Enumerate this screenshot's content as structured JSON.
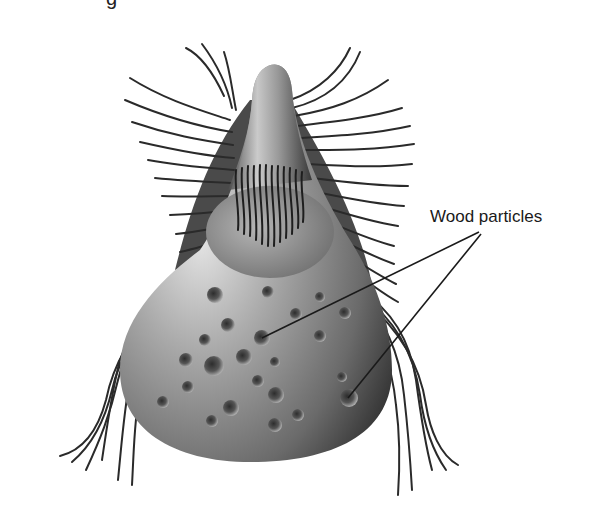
{
  "figure": {
    "cropped_top_text_fragment": "g",
    "labels": [
      {
        "id": "wood-particles",
        "text": "Wood particles",
        "x": 430,
        "y": 207
      }
    ],
    "pointer_lines": [
      {
        "from": [
          479,
          232
        ],
        "to": [
          262,
          338
        ]
      },
      {
        "from": [
          481,
          234
        ],
        "to": [
          348,
          398
        ]
      }
    ],
    "wood_particles": [
      [
        215,
        295
      ],
      [
        268,
        292
      ],
      [
        228,
        325
      ],
      [
        262,
        338
      ],
      [
        296,
        314
      ],
      [
        320,
        297
      ],
      [
        320,
        336
      ],
      [
        205,
        340
      ],
      [
        244,
        357
      ],
      [
        275,
        362
      ],
      [
        214,
        366
      ],
      [
        186,
        360
      ],
      [
        188,
        387
      ],
      [
        258,
        381
      ],
      [
        276,
        395
      ],
      [
        231,
        408
      ],
      [
        298,
        415
      ],
      [
        163,
        402
      ],
      [
        212,
        421
      ],
      [
        275,
        425
      ],
      [
        349,
        398
      ],
      [
        342,
        377
      ],
      [
        345,
        313
      ]
    ],
    "colors": {
      "background": "#ffffff",
      "ink": "#1a1a1a",
      "body_light": "#c9c9c9",
      "body_mid": "#8a8a8a",
      "body_dark": "#3a3a3a"
    }
  }
}
